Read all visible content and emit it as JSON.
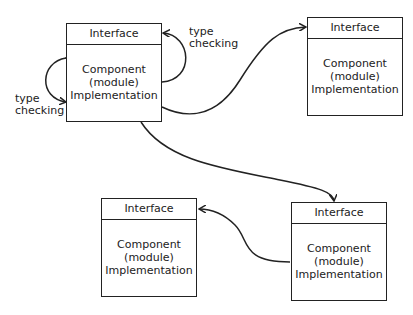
{
  "components": [
    {
      "id": "top-left",
      "interface": "Interface",
      "body": [
        "Component",
        "(module)",
        "Implementation"
      ]
    },
    {
      "id": "top-right",
      "interface": "Interface",
      "body": [
        "Component",
        "(module)",
        "Implementation"
      ]
    },
    {
      "id": "bottom-left",
      "interface": "Interface",
      "body": [
        "Component",
        "(module)",
        "Implementation"
      ]
    },
    {
      "id": "bottom-right",
      "interface": "Interface",
      "body": [
        "Component",
        "(module)",
        "Implementation"
      ]
    }
  ],
  "labels": {
    "left_loop": [
      "type",
      "checking"
    ],
    "right_loop": [
      "type",
      "checking"
    ]
  },
  "edges": [
    {
      "from": "top-left",
      "to": "top-left",
      "label": "type checking"
    },
    {
      "from": "top-left",
      "to": "top-left",
      "label": "type checking"
    },
    {
      "from": "top-left",
      "to": "top-right"
    },
    {
      "from": "top-left",
      "to": "bottom-right"
    },
    {
      "from": "bottom-right",
      "to": "bottom-left"
    }
  ],
  "colors": {
    "stroke": "#222222",
    "background": "#ffffff"
  }
}
